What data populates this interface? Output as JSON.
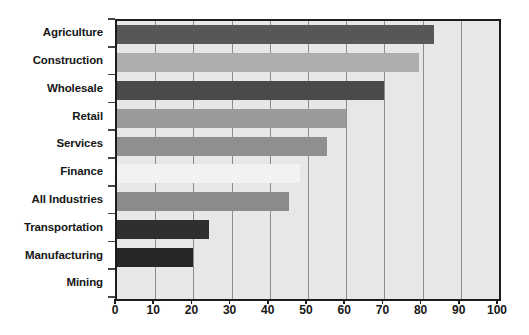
{
  "chart_data": {
    "type": "bar",
    "orientation": "horizontal",
    "title": "",
    "subtitle": "",
    "xlabel": "",
    "ylabel": "",
    "xlim": [
      0,
      100
    ],
    "xticks": [
      0,
      10,
      20,
      30,
      40,
      50,
      60,
      70,
      80,
      90,
      100
    ],
    "xtick_labels": [
      "0",
      "10",
      "20",
      "30",
      "40",
      "50",
      "60",
      "70",
      "80",
      "90",
      "100"
    ],
    "grid": "vertical",
    "legend": "none",
    "categories": [
      "Agriculture",
      "Construction",
      "Wholesale",
      "Retail",
      "Services",
      "Finance",
      "All Industries",
      "Transportation",
      "Manufacturing",
      "Mining"
    ],
    "values": [
      83,
      79,
      70,
      60,
      55,
      48,
      45,
      24,
      20,
      0
    ],
    "bar_colors": [
      "#575757",
      "#adadad",
      "#4a4a4a",
      "#9a9a9a",
      "#8f8f8f",
      "#f2f2f2",
      "#8b8b8b",
      "#2f2f2f",
      "#262626",
      "#e7e7e7"
    ],
    "plot_background": "#e7e7e7",
    "gridline_color": "#8d8d8d",
    "border_color": "#1c1c1c",
    "label_color": "#161616"
  }
}
